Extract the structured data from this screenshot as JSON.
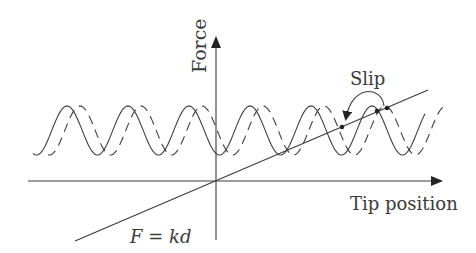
{
  "diagram": {
    "labels": {
      "y_axis": "Force",
      "x_axis": "Tip position",
      "slip": "Slip",
      "spring_law": "F = kd",
      "spring_law_var_F": "F",
      "spring_law_eq": " = ",
      "spring_law_var_kd": "kd"
    },
    "colors": {
      "line": "#3a3a3a",
      "background": "#ffffff"
    },
    "geometry": {
      "origin": [
        216,
        181
      ],
      "x_axis": {
        "from": [
          28,
          181
        ],
        "to": [
          441,
          181
        ]
      },
      "y_axis": {
        "from": [
          216,
          240
        ],
        "to": [
          216,
          38
        ]
      },
      "spring_line": {
        "from": [
          75,
          241
        ],
        "to": [
          428,
          90
        ]
      },
      "solid_wave": {
        "x_start": 33,
        "x_end": 425,
        "center_y": 130.5,
        "amplitude": 24.5,
        "period": 61,
        "first_peak_x": 67
      },
      "dashed_wave": {
        "x_start": 48,
        "x_end": 444,
        "center_y": 130.5,
        "amplitude": 24.5,
        "period": 61,
        "first_peak_x": 80
      },
      "slip_points": [
        [
          342,
          127
        ],
        [
          377,
          111
        ],
        [
          387,
          108
        ]
      ]
    }
  }
}
